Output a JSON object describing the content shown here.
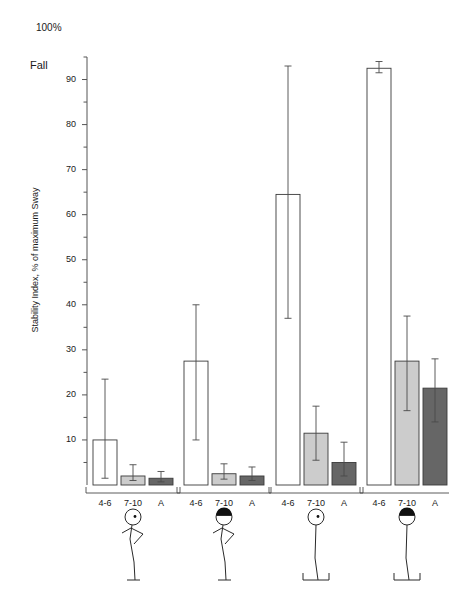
{
  "chart_data": {
    "type": "bar",
    "title": "",
    "subtitle": "",
    "xlabel": "",
    "ylabel": "Stability Index, % of maximum Sway",
    "ylim": [
      0,
      95
    ],
    "yticks_labeled": [
      10,
      20,
      30,
      40,
      50,
      60,
      70,
      80,
      90
    ],
    "ytick_step_minor": 5,
    "grid": false,
    "legend_position": "none",
    "top_annotation": "100%",
    "ceiling_annotation": "Fall",
    "categories": [
      "4-6",
      "7-10",
      "A"
    ],
    "groups": [
      {
        "name": "eyes-open-normal-stance",
        "pictogram": "standing-eyes-open",
        "bars": [
          {
            "category": "4-6",
            "value": 10.0,
            "err_low": 8.5,
            "err_high": 13.5,
            "fill": "#ffffff"
          },
          {
            "category": "7-10",
            "value": 2.0,
            "err_low": 1.0,
            "err_high": 2.5,
            "fill": "#cccccc"
          },
          {
            "category": "A",
            "value": 1.5,
            "err_low": 0.8,
            "err_high": 1.5,
            "fill": "#666666"
          }
        ]
      },
      {
        "name": "eyes-closed-normal-stance",
        "pictogram": "standing-eyes-closed",
        "bars": [
          {
            "category": "4-6",
            "value": 27.5,
            "err_low": 17.5,
            "err_high": 12.5,
            "fill": "#ffffff"
          },
          {
            "category": "7-10",
            "value": 2.5,
            "err_low": 1.2,
            "err_high": 2.2,
            "fill": "#cccccc"
          },
          {
            "category": "A",
            "value": 2.0,
            "err_low": 1.0,
            "err_high": 2.0,
            "fill": "#666666"
          }
        ]
      },
      {
        "name": "eyes-open-foam-platform",
        "pictogram": "standing-eyes-open-platform",
        "bars": [
          {
            "category": "4-6",
            "value": 64.5,
            "err_low": 27.5,
            "err_high": 28.5,
            "fill": "#ffffff"
          },
          {
            "category": "7-10",
            "value": 11.5,
            "err_low": 6.0,
            "err_high": 6.0,
            "fill": "#cccccc"
          },
          {
            "category": "A",
            "value": 5.0,
            "err_low": 3.0,
            "err_high": 4.5,
            "fill": "#666666"
          }
        ]
      },
      {
        "name": "eyes-closed-foam-platform",
        "pictogram": "standing-eyes-closed-platform",
        "bars": [
          {
            "category": "4-6",
            "value": 92.5,
            "err_low": 1.0,
            "err_high": 1.5,
            "fill": "#ffffff"
          },
          {
            "category": "7-10",
            "value": 27.5,
            "err_low": 11.0,
            "err_high": 10.0,
            "fill": "#cccccc"
          },
          {
            "category": "A",
            "value": 21.5,
            "err_low": 7.5,
            "err_high": 6.5,
            "fill": "#666666"
          }
        ]
      }
    ],
    "colors": {
      "bar_age_4_6": "#ffffff",
      "bar_age_7_10": "#cccccc",
      "bar_adult": "#666666",
      "axis": "#555555",
      "text": "#1a1a1a"
    }
  }
}
